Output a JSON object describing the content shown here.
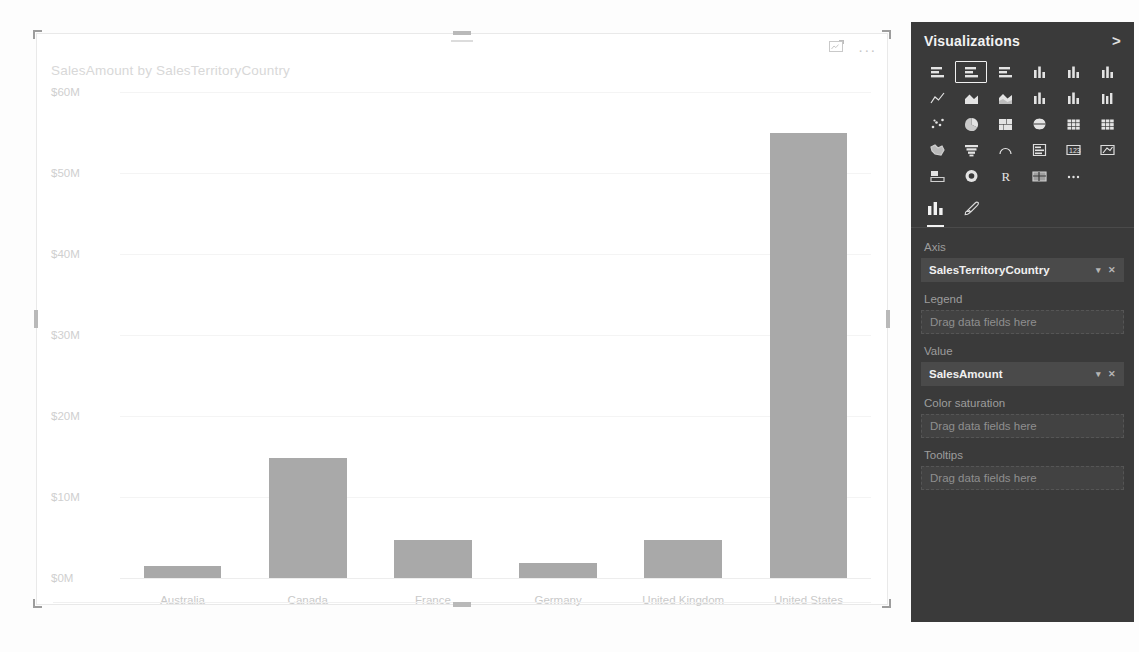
{
  "chart_data": {
    "type": "bar",
    "title": "SalesAmount by SalesTerritoryCountry",
    "xlabel": "",
    "ylabel": "",
    "categories": [
      "Australia",
      "Canada",
      "France",
      "Germany",
      "United Kingdom",
      "United States"
    ],
    "values": [
      1.5,
      14.8,
      4.7,
      1.9,
      4.7,
      55.0
    ],
    "value_unit": "M",
    "ylim": [
      0,
      60
    ],
    "yticks": [
      60,
      50,
      40,
      30,
      20,
      10,
      0
    ],
    "ytick_labels": [
      "$60M",
      "$50M",
      "$40M",
      "$30M",
      "$20M",
      "$10M",
      "$0M"
    ],
    "grid": true,
    "legend": "none",
    "bar_color": "#a9a9a9"
  },
  "visual": {
    "title": "SalesAmount by SalesTerritoryCountry",
    "focus_mode_label": "Focus mode",
    "more_options_label": "..."
  },
  "viz_pane": {
    "header": "Visualizations",
    "collapse_chevron": ">",
    "icons": [
      {
        "name": "stacked-bar-chart-icon",
        "selected": false
      },
      {
        "name": "clustered-bar-chart-icon",
        "selected": true
      },
      {
        "name": "hundred-percent-stacked-bar-chart-icon",
        "selected": false
      },
      {
        "name": "stacked-column-chart-icon",
        "selected": false
      },
      {
        "name": "clustered-column-chart-icon",
        "selected": false
      },
      {
        "name": "hundred-percent-stacked-column-chart-icon",
        "selected": false
      },
      {
        "name": "line-chart-icon",
        "selected": false
      },
      {
        "name": "area-chart-icon",
        "selected": false
      },
      {
        "name": "stacked-area-chart-icon",
        "selected": false
      },
      {
        "name": "line-and-stacked-column-chart-icon",
        "selected": false
      },
      {
        "name": "line-and-clustered-column-chart-icon",
        "selected": false
      },
      {
        "name": "ribbon-chart-icon",
        "selected": false
      },
      {
        "name": "scatter-chart-icon",
        "selected": false
      },
      {
        "name": "pie-chart-icon",
        "selected": false
      },
      {
        "name": "treemap-icon",
        "selected": false
      },
      {
        "name": "map-icon",
        "selected": false
      },
      {
        "name": "matrix-icon",
        "selected": false
      },
      {
        "name": "table-icon",
        "selected": false
      },
      {
        "name": "filled-map-icon",
        "selected": false
      },
      {
        "name": "funnel-chart-icon",
        "selected": false
      },
      {
        "name": "gauge-icon",
        "selected": false
      },
      {
        "name": "multi-row-card-icon",
        "selected": false
      },
      {
        "name": "card-icon",
        "selected": false
      },
      {
        "name": "kpi-icon",
        "selected": false
      },
      {
        "name": "slicer-icon",
        "selected": false
      },
      {
        "name": "donut-chart-icon",
        "selected": false
      },
      {
        "name": "r-script-visual-icon",
        "selected": false
      },
      {
        "name": "shape-map-icon",
        "selected": false
      },
      {
        "name": "more-visuals-icon",
        "selected": false
      }
    ],
    "tabs": [
      {
        "name": "fields-tab",
        "icon": "bar-chart-icon",
        "active": true
      },
      {
        "name": "format-tab",
        "icon": "paintbrush-icon",
        "active": false
      }
    ],
    "wells": [
      {
        "label": "Axis",
        "value": "SalesTerritoryCountry",
        "empty": false
      },
      {
        "label": "Legend",
        "value": "Drag data fields here",
        "empty": true
      },
      {
        "label": "Value",
        "value": "SalesAmount",
        "empty": false
      },
      {
        "label": "Color saturation",
        "value": "Drag data fields here",
        "empty": true
      },
      {
        "label": "Tooltips",
        "value": "Drag data fields here",
        "empty": true
      }
    ]
  }
}
